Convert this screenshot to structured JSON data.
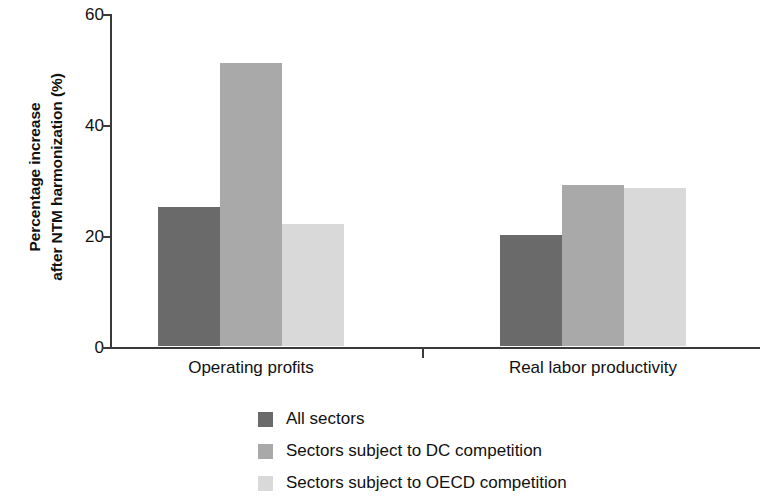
{
  "chart_data": {
    "type": "bar",
    "title": "",
    "subtitle": "",
    "xlabel": "",
    "ylabel": "Percentage increase after NTM harmonization (%)",
    "ylabel_lines": [
      "Percentage increase",
      "after NTM harmonization (%)"
    ],
    "categories": [
      "Operating profits",
      "Real labor productivity"
    ],
    "series": [
      {
        "name": "All sectors",
        "color": "#6a6a6a",
        "values": [
          25,
          20
        ]
      },
      {
        "name": "Sectors subject to DC competition",
        "color": "#a9a9a9",
        "values": [
          51,
          29
        ]
      },
      {
        "name": "Sectors subject to OECD competition",
        "color": "#d9d9d9",
        "values": [
          22,
          28.5
        ]
      }
    ],
    "ylim": [
      0,
      60
    ],
    "yticks": [
      0,
      20,
      40,
      60
    ],
    "ytick_labels": [
      "0",
      "20",
      "40",
      "60"
    ],
    "grid": false,
    "legend_position": "bottom-center",
    "legend_entries": [
      "All sectors",
      "Sectors subject to DC competition",
      "Sectors subject to OECD competition"
    ]
  },
  "axis": {
    "ytick_0": "0",
    "ytick_1": "20",
    "ytick_2": "40",
    "ytick_3": "60"
  },
  "labels": {
    "ylabel_line1": "Percentage increase",
    "ylabel_line2": "after NTM harmonization (%)",
    "cat_0": "Operating profits",
    "cat_1": "Real labor productivity"
  },
  "legend": {
    "item_0": "All sectors",
    "item_1": "Sectors subject to DC competition",
    "item_2": "Sectors subject to OECD competition"
  }
}
